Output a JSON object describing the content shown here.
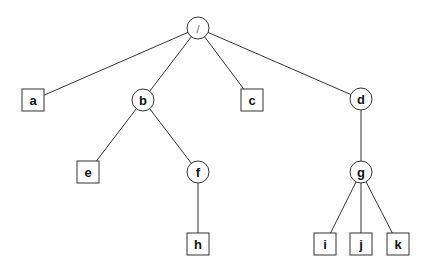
{
  "diagram": {
    "type": "tree",
    "nodes": [
      {
        "id": "root",
        "label": "/",
        "shape": "circle",
        "x": 198,
        "y": 28
      },
      {
        "id": "a",
        "label": "a",
        "shape": "square",
        "x": 33,
        "y": 100
      },
      {
        "id": "b",
        "label": "b",
        "shape": "circle",
        "x": 143,
        "y": 100
      },
      {
        "id": "c",
        "label": "c",
        "shape": "square",
        "x": 252,
        "y": 100
      },
      {
        "id": "d",
        "label": "d",
        "shape": "circle",
        "x": 361,
        "y": 99
      },
      {
        "id": "e",
        "label": "e",
        "shape": "square",
        "x": 88,
        "y": 172
      },
      {
        "id": "f",
        "label": "f",
        "shape": "circle",
        "x": 198,
        "y": 172
      },
      {
        "id": "g",
        "label": "g",
        "shape": "circle",
        "x": 361,
        "y": 172
      },
      {
        "id": "h",
        "label": "h",
        "shape": "square",
        "x": 198,
        "y": 244
      },
      {
        "id": "i",
        "label": "i",
        "shape": "square",
        "x": 325,
        "y": 244
      },
      {
        "id": "j",
        "label": "j",
        "shape": "square",
        "x": 361,
        "y": 244
      },
      {
        "id": "k",
        "label": "k",
        "shape": "square",
        "x": 398,
        "y": 244
      }
    ],
    "edges": [
      [
        "root",
        "a"
      ],
      [
        "root",
        "b"
      ],
      [
        "root",
        "c"
      ],
      [
        "root",
        "d"
      ],
      [
        "b",
        "e"
      ],
      [
        "b",
        "f"
      ],
      [
        "f",
        "h"
      ],
      [
        "d",
        "g"
      ],
      [
        "g",
        "i"
      ],
      [
        "g",
        "j"
      ],
      [
        "g",
        "k"
      ]
    ],
    "legend": {
      "circle": "directory",
      "square": "file"
    }
  }
}
